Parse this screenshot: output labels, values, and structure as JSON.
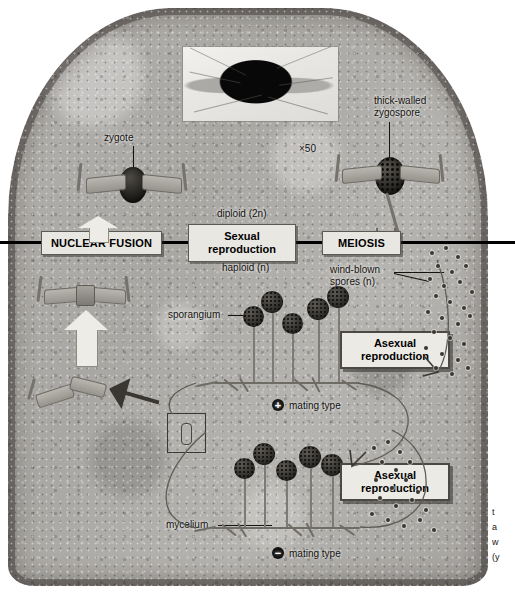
{
  "figure": {
    "magnification_label": "×50"
  },
  "divider": {
    "above_label": "diploid (2n)",
    "below_label": "haploid (n)",
    "phases": [
      {
        "id": "nuclear-fusion",
        "label": "NUCLEAR FUSION"
      },
      {
        "id": "sexual-reproduction",
        "label": "Sexual\nreproduction"
      },
      {
        "id": "meiosis",
        "label": "MEIOSIS"
      }
    ]
  },
  "callouts": {
    "zygote": "zygote",
    "thick_walled_zygospore": "thick-walled\nzygospore",
    "wind_blown_spores": "wind-blown\nspores (n)",
    "sporangium": "sporangium",
    "mycelium": "mycelium"
  },
  "asexual_boxes": [
    {
      "id": "asexual-top",
      "label": "Asexual\nreproduction"
    },
    {
      "id": "asexual-bottom",
      "label": "Asexual\nreproduction"
    }
  ],
  "mating_types": [
    {
      "id": "plus",
      "symbol": "+",
      "label": "mating type"
    },
    {
      "id": "minus",
      "symbol": "−",
      "label": "mating type"
    }
  ],
  "side_caption": {
    "lines": [
      "t",
      "a",
      "w",
      "(y"
    ]
  },
  "colors": {
    "bread_crumb": "#b0aeaa",
    "crust": "#4a4641",
    "box_fill": "#e9e7e2",
    "box_border": "#4c4945",
    "divider_line": "#000000",
    "spore_dark": "#2a2825",
    "text": "#15130f"
  }
}
